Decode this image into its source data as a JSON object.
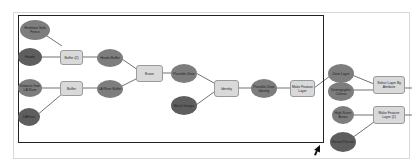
{
  "diagram": {
    "type": "ArcGIS ModelBuilder model",
    "nodes": [
      {
        "id": "n1",
        "label": "Hedmore Solo Fence",
        "kind": "data"
      },
      {
        "id": "n2",
        "label": "Hoods",
        "kind": "data"
      },
      {
        "id": "n3",
        "label": "Buffer (2)",
        "kind": "tool"
      },
      {
        "id": "n4",
        "label": "Hoods Buffer",
        "kind": "data"
      },
      {
        "id": "n5",
        "label": "Distance from LA River",
        "kind": "data"
      },
      {
        "id": "n6",
        "label": "Buffer",
        "kind": "tool"
      },
      {
        "id": "n7",
        "label": "LA River Buffer",
        "kind": "data"
      },
      {
        "id": "n8",
        "label": "LARiver",
        "kind": "data"
      },
      {
        "id": "n9",
        "label": "Erase",
        "kind": "tool"
      },
      {
        "id": "n10",
        "label": "Possible Zone",
        "kind": "data"
      },
      {
        "id": "n11",
        "label": "Block Groups",
        "kind": "data"
      },
      {
        "id": "n12",
        "label": "Identity",
        "kind": "tool"
      },
      {
        "id": "n13",
        "label": "Possible Zone Identity",
        "kind": "data"
      },
      {
        "id": "n14",
        "label": "Make Feature Layer",
        "kind": "tool"
      },
      {
        "id": "n15",
        "label": "Zone Layer",
        "kind": "data"
      },
      {
        "id": "n16",
        "label": "Demographic Criteria",
        "kind": "data"
      },
      {
        "id": "n17",
        "label": "Select Layer By Attribute",
        "kind": "tool"
      },
      {
        "id": "n18",
        "label": "High Score Areas",
        "kind": "data"
      },
      {
        "id": "n19",
        "label": "Make Feature Layer (2)",
        "kind": "tool"
      },
      {
        "id": "n20",
        "label": "Vacant Parcels",
        "kind": "data"
      }
    ],
    "param_marker": "P"
  }
}
